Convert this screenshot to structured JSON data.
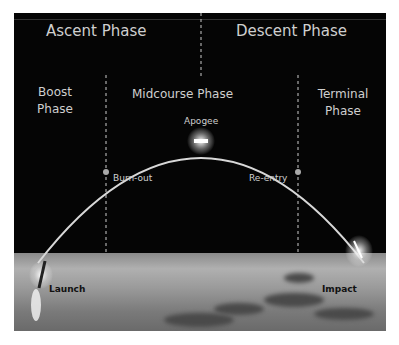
{
  "diagram": {
    "headers": {
      "ascent": "Ascent Phase",
      "descent": "Descent Phase"
    },
    "phases": {
      "boost": [
        "Boost",
        "Phase"
      ],
      "midcourse": "Midcourse Phase",
      "terminal": [
        "Terminal",
        "Phase"
      ]
    },
    "points": {
      "apogee": "Apogee",
      "burnout": "Burn-out",
      "reentry": "Re-entry",
      "launch": "Launch",
      "impact": "Impact"
    },
    "colors": {
      "background": "#050505",
      "text": "#cfcfcf",
      "trajectory": "#d8d8d8",
      "label_dark": "#111111"
    }
  }
}
